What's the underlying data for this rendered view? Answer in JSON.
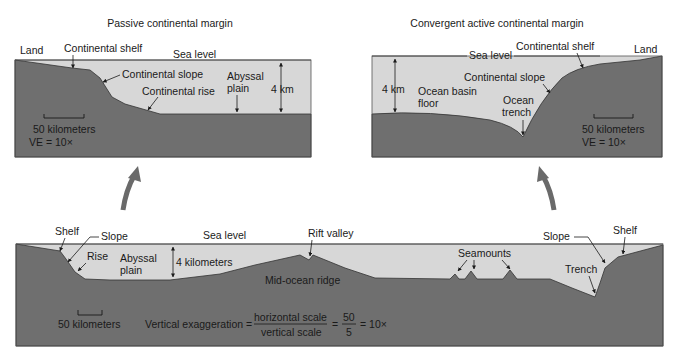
{
  "colors": {
    "water": "#d7d7d7",
    "rock": "#6f6f6f",
    "outline": "#333333",
    "arrow": "#6a6a6a",
    "background": "#ffffff",
    "text": "#1a1a1a"
  },
  "passive_panel": {
    "title": "Passive continental margin",
    "labels": {
      "land": "Land",
      "continental_shelf": "Continental shelf",
      "sea_level": "Sea level",
      "continental_slope": "Continental slope",
      "continental_rise": "Continental rise",
      "abyssal_plain_1": "Abyssal",
      "abyssal_plain_2": "plain",
      "depth": "4 km",
      "scale": "50 kilometers",
      "ve": "VE = 10×"
    }
  },
  "convergent_panel": {
    "title": "Convergent active continental margin",
    "labels": {
      "sea_level": "Sea level",
      "continental_shelf": "Continental shelf",
      "land": "Land",
      "depth": "4 km",
      "continental_slope": "Continental slope",
      "ocean_basin_1": "Ocean basin",
      "ocean_basin_2": "floor",
      "ocean_trench_1": "Ocean",
      "ocean_trench_2": "trench",
      "scale": "50 kilometers",
      "ve": "VE = 10×"
    }
  },
  "ocean_profile_panel": {
    "labels": {
      "shelf_left": "Shelf",
      "slope_left": "Slope",
      "rise": "Rise",
      "abyssal_plain_1": "Abyssal",
      "abyssal_plain_2": "plain",
      "depth": "4 kilometers",
      "sea_level": "Sea level",
      "rift_valley": "Rift valley",
      "mid_ocean_ridge": "Mid-ocean ridge",
      "seamounts": "Seamounts",
      "slope_right": "Slope",
      "shelf_right": "Shelf",
      "trench": "Trench",
      "scale": "50 kilometers",
      "ve_label": "Vertical exaggeration =",
      "ve_numerator": "horizontal scale",
      "ve_denominator": "vertical scale",
      "ve_eq2": "=",
      "ve_num2": "50",
      "ve_den2": "5",
      "ve_result": "= 10×"
    }
  }
}
